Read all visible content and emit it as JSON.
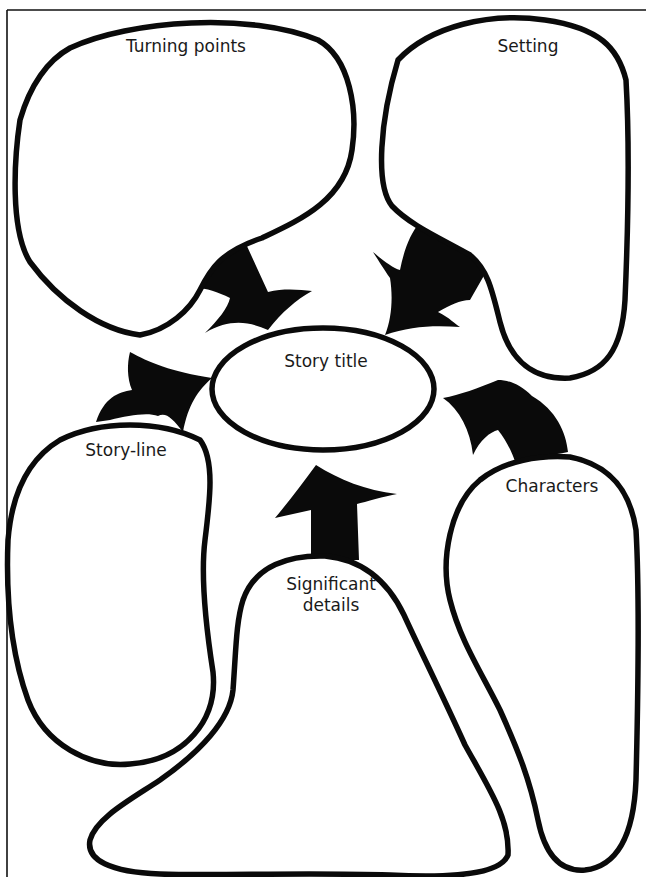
{
  "diagram": {
    "type": "story-map-graphic-organizer",
    "colors": {
      "outline": "#0a0a0a",
      "background": "#ffffff",
      "text": "#1a1a1a"
    },
    "center": {
      "label": "Story title"
    },
    "nodes": [
      {
        "id": "turning-points",
        "label": "Turning points",
        "position": "top-left"
      },
      {
        "id": "setting",
        "label": "Setting",
        "position": "top-right"
      },
      {
        "id": "story-line",
        "label": "Story-line",
        "position": "middle-left"
      },
      {
        "id": "characters",
        "label": "Characters",
        "position": "middle-right"
      },
      {
        "id": "significant-details",
        "label_line1": "Significant",
        "label_line2": "details",
        "position": "bottom-center"
      }
    ],
    "edges": [
      {
        "from": "turning-points",
        "to": "story-title"
      },
      {
        "from": "setting",
        "to": "story-title"
      },
      {
        "from": "story-line",
        "to": "story-title"
      },
      {
        "from": "characters",
        "to": "story-title"
      },
      {
        "from": "significant-details",
        "to": "story-title"
      }
    ]
  }
}
